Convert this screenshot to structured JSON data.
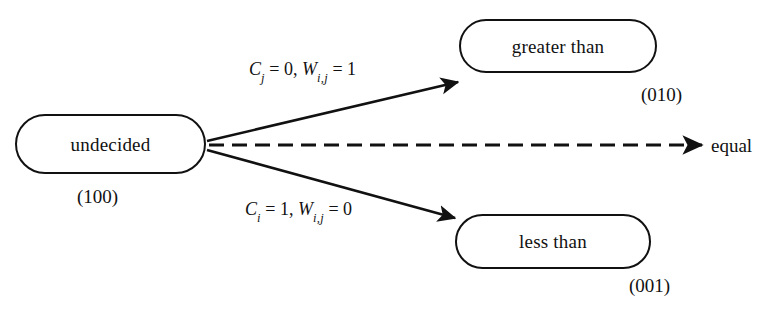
{
  "diagram": {
    "background_color": "#ffffff",
    "stroke_color": "#111111",
    "nodes": [
      {
        "id": "undecided",
        "label": "undecided",
        "code": "(100)",
        "shape": "stadium"
      },
      {
        "id": "greater_than",
        "label": "greater than",
        "code": "(010)",
        "shape": "stadium"
      },
      {
        "id": "less_than",
        "label": "less than",
        "code": "(001)",
        "shape": "stadium"
      }
    ],
    "edges": [
      {
        "id": "to-greater-than",
        "from": "undecided",
        "to": "greater_than",
        "style": "solid",
        "arrow": true,
        "label": {
          "text": "Cj = 0, Wi,j = 1",
          "terms": [
            {
              "var": "C",
              "sub": "j",
              "value": "0"
            },
            {
              "var": "W",
              "sub": "i,j",
              "value": "1"
            }
          ]
        }
      },
      {
        "id": "to-equal",
        "from": "undecided",
        "to": "equal",
        "style": "dashed",
        "arrow": true,
        "label": null,
        "target_text": "equal"
      },
      {
        "id": "to-less-than",
        "from": "undecided",
        "to": "less_than",
        "style": "solid",
        "arrow": true,
        "label": {
          "text": "Ci = 1, Wi,j = 0",
          "terms": [
            {
              "var": "C",
              "sub": "i",
              "value": "1"
            },
            {
              "var": "W",
              "sub": "i,j",
              "value": "0"
            }
          ]
        }
      }
    ],
    "labels": {
      "equal": "equal",
      "comma_separator": ", ",
      "equals_sign": " = "
    }
  }
}
